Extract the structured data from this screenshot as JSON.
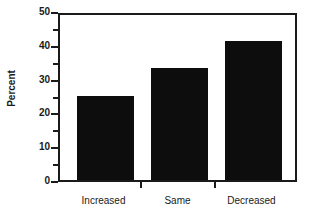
{
  "chart_data": {
    "type": "bar",
    "title": "",
    "xlabel": "",
    "ylabel": "Percent",
    "categories": [
      "Increased",
      "Same",
      "Decreased"
    ],
    "values": [
      25,
      33,
      41
    ],
    "ylim": [
      0,
      50
    ],
    "ytick_labels": [
      "0",
      "10",
      "20",
      "30",
      "40",
      "50"
    ],
    "ytick_values": [
      0,
      10,
      20,
      30,
      40,
      50
    ],
    "yminor_tick_values": [
      5,
      15,
      25,
      35,
      45
    ],
    "grid": false,
    "legend": false,
    "legend_position": "none",
    "bar_color": "#0d0d0d",
    "axis_color": "#1a1a1a",
    "background_color": "#ffffff"
  }
}
